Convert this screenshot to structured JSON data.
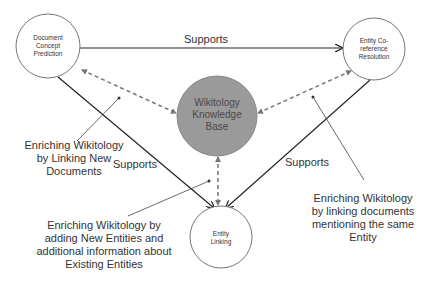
{
  "diagram": {
    "nodes": [
      {
        "id": "dcp",
        "label": "Document Concept Prediction",
        "lines": [
          "Document",
          "Concept",
          "Prediction"
        ],
        "fill": "#ffffff"
      },
      {
        "id": "ecr",
        "label": "Entity Co-reference Resolution",
        "lines": [
          "Entity Co-",
          "reference",
          "Resolution"
        ],
        "fill": "#ffffff"
      },
      {
        "id": "kb",
        "label": "Wikitology Knowledge Base",
        "lines": [
          "Wikitology",
          "Knowledge",
          "Base"
        ],
        "fill": "#9a9a9a"
      },
      {
        "id": "el",
        "label": "Entity Linking",
        "lines": [
          "Entity",
          "Linking"
        ],
        "fill": "#ffffff"
      }
    ],
    "edges": [
      {
        "from": "dcp",
        "to": "ecr",
        "label": "Supports",
        "style": "solid"
      },
      {
        "from": "dcp",
        "to": "el",
        "label": "Supports",
        "style": "solid"
      },
      {
        "from": "ecr",
        "to": "el",
        "label": "Supports",
        "style": "solid"
      },
      {
        "from": "kb",
        "to": "dcp",
        "label": "",
        "style": "dashed-bidirectional"
      },
      {
        "from": "kb",
        "to": "ecr",
        "label": "",
        "style": "dashed-bidirectional"
      },
      {
        "from": "kb",
        "to": "el",
        "label": "",
        "style": "dashed-bidirectional"
      }
    ],
    "annotations": [
      {
        "id": "note-dcp",
        "lines": [
          "Enriching Wikitology",
          "by Linking New",
          "Documents"
        ]
      },
      {
        "id": "note-el",
        "lines": [
          "Enriching Wikitology by",
          "adding New Entities and",
          "additional information about",
          "Existing Entities"
        ]
      },
      {
        "id": "note-ecr",
        "lines": [
          "Enriching Wikitology",
          "by linking documents",
          "mentioning the same",
          "Entity"
        ]
      }
    ],
    "colors": {
      "line": "#222222",
      "dashed": "#777777",
      "kb_fill": "#9a9a9a",
      "circle_stroke": "#777777"
    }
  }
}
